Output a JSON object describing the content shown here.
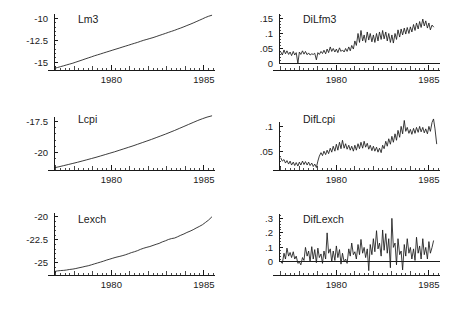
{
  "figure": {
    "width": 450,
    "height": 310,
    "background": "#ffffff",
    "line_color": "#1a1a1a",
    "layout": "2 columns x 3 rows of time-series panels"
  },
  "chart_data": [
    {
      "id": "lm3",
      "type": "line",
      "title": "Lm3",
      "xlabel": "",
      "ylabel": "",
      "grid": false,
      "legend": "none",
      "xlim": [
        1976.9,
        1985.6
      ],
      "ylim": [
        -15.9,
        -9.5
      ],
      "xticks": [
        1980,
        1985
      ],
      "xticklabels": [
        "1980",
        "1985"
      ],
      "yticks": [
        -10,
        -12.5,
        -15
      ],
      "yticklabels": [
        "-10",
        "-12.5",
        "-15"
      ],
      "x": [
        1976.92,
        1977.08,
        1977.25,
        1977.42,
        1977.58,
        1977.75,
        1977.92,
        1978.08,
        1978.25,
        1978.42,
        1978.58,
        1978.75,
        1978.92,
        1979.08,
        1979.25,
        1979.42,
        1979.58,
        1979.75,
        1979.92,
        1980.08,
        1980.25,
        1980.42,
        1980.58,
        1980.75,
        1980.92,
        1981.08,
        1981.25,
        1981.42,
        1981.58,
        1981.75,
        1981.92,
        1982.08,
        1982.25,
        1982.42,
        1982.58,
        1982.75,
        1982.92,
        1983.08,
        1983.25,
        1983.42,
        1983.58,
        1983.75,
        1983.92,
        1984.08,
        1984.25,
        1984.42,
        1984.58,
        1984.75,
        1984.92,
        1985.08,
        1985.25,
        1985.42
      ],
      "values": [
        -15.72,
        -15.62,
        -15.52,
        -15.42,
        -15.32,
        -15.22,
        -15.12,
        -15.0,
        -14.88,
        -14.76,
        -14.64,
        -14.52,
        -14.4,
        -14.28,
        -14.17,
        -14.06,
        -13.95,
        -13.84,
        -13.73,
        -13.62,
        -13.51,
        -13.4,
        -13.29,
        -13.18,
        -13.07,
        -12.96,
        -12.85,
        -12.74,
        -12.62,
        -12.5,
        -12.4,
        -12.3,
        -12.2,
        -12.08,
        -11.96,
        -11.84,
        -11.72,
        -11.6,
        -11.48,
        -11.36,
        -11.23,
        -11.1,
        -10.96,
        -10.82,
        -10.68,
        -10.53,
        -10.38,
        -10.22,
        -10.06,
        -9.9,
        -9.76,
        -9.65
      ]
    },
    {
      "id": "dilfm3",
      "type": "line",
      "title": "DiLfm3",
      "xlabel": "",
      "ylabel": "",
      "grid": false,
      "legend": "none",
      "xlim": [
        1976.9,
        1985.6
      ],
      "ylim": [
        -0.022,
        0.165
      ],
      "xticks": [
        1980,
        1985
      ],
      "xticklabels": [
        "1980",
        "1985"
      ],
      "yticks": [
        0.15,
        0.1,
        0.05,
        0
      ],
      "yticklabels": [
        ".15",
        ".1",
        ".05",
        "0"
      ],
      "zero_line": 0,
      "x": [
        1977.0,
        1977.08,
        1977.17,
        1977.25,
        1977.33,
        1977.42,
        1977.5,
        1977.58,
        1977.67,
        1977.75,
        1977.83,
        1977.92,
        1978.0,
        1978.08,
        1978.17,
        1978.25,
        1978.33,
        1978.42,
        1978.5,
        1978.58,
        1978.67,
        1978.75,
        1978.83,
        1978.92,
        1979.0,
        1979.08,
        1979.17,
        1979.25,
        1979.33,
        1979.42,
        1979.5,
        1979.58,
        1979.67,
        1979.75,
        1979.83,
        1979.92,
        1980.0,
        1980.08,
        1980.17,
        1980.25,
        1980.33,
        1980.42,
        1980.5,
        1980.58,
        1980.67,
        1980.75,
        1980.83,
        1980.92,
        1981.0,
        1981.08,
        1981.17,
        1981.25,
        1981.33,
        1981.42,
        1981.5,
        1981.58,
        1981.67,
        1981.75,
        1981.83,
        1981.92,
        1982.0,
        1982.08,
        1982.17,
        1982.25,
        1982.33,
        1982.42,
        1982.5,
        1982.58,
        1982.67,
        1982.75,
        1982.83,
        1982.92,
        1983.0,
        1983.08,
        1983.17,
        1983.25,
        1983.33,
        1983.42,
        1983.5,
        1983.58,
        1983.67,
        1983.75,
        1983.83,
        1983.92,
        1984.0,
        1984.08,
        1984.17,
        1984.25,
        1984.33,
        1984.42,
        1984.5,
        1984.58,
        1984.67,
        1984.75,
        1984.83,
        1984.92,
        1985.0,
        1985.08,
        1985.17,
        1985.25,
        1985.33,
        1985.42
      ],
      "values": [
        0.038,
        0.028,
        0.045,
        0.032,
        0.042,
        0.03,
        0.038,
        0.026,
        0.04,
        0.028,
        0.036,
        0.0,
        0.038,
        0.03,
        0.042,
        0.031,
        0.04,
        0.029,
        0.035,
        0.028,
        0.032,
        0.03,
        0.034,
        0.012,
        0.036,
        0.03,
        0.04,
        0.033,
        0.044,
        0.032,
        0.048,
        0.036,
        0.055,
        0.04,
        0.05,
        0.038,
        0.048,
        0.036,
        0.052,
        0.04,
        0.045,
        0.038,
        0.05,
        0.04,
        0.055,
        0.042,
        0.06,
        0.048,
        0.075,
        0.06,
        0.1,
        0.07,
        0.11,
        0.075,
        0.095,
        0.07,
        0.105,
        0.078,
        0.1,
        0.072,
        0.095,
        0.07,
        0.1,
        0.075,
        0.105,
        0.08,
        0.11,
        0.082,
        0.105,
        0.075,
        0.1,
        0.07,
        0.095,
        0.068,
        0.1,
        0.08,
        0.112,
        0.088,
        0.115,
        0.095,
        0.118,
        0.098,
        0.12,
        0.1,
        0.122,
        0.105,
        0.13,
        0.11,
        0.135,
        0.115,
        0.14,
        0.12,
        0.148,
        0.125,
        0.142,
        0.118,
        0.135,
        0.112,
        0.128,
        0.122
      ]
    },
    {
      "id": "lcpi",
      "type": "line",
      "title": "Lcpi",
      "xlabel": "",
      "ylabel": "",
      "grid": false,
      "legend": "none",
      "xlim": [
        1976.9,
        1985.6
      ],
      "ylim": [
        -21.4,
        -16.9
      ],
      "xticks": [
        1980,
        1985
      ],
      "xticklabels": [
        "1980",
        "1985"
      ],
      "yticks": [
        -17.5,
        -20
      ],
      "yticklabels": [
        "-17.5",
        "-20"
      ],
      "x": [
        1976.92,
        1977.17,
        1977.42,
        1977.67,
        1977.92,
        1978.17,
        1978.42,
        1978.67,
        1978.92,
        1979.17,
        1979.42,
        1979.67,
        1979.92,
        1980.17,
        1980.42,
        1980.67,
        1980.92,
        1981.17,
        1981.42,
        1981.67,
        1981.92,
        1982.17,
        1982.42,
        1982.67,
        1982.92,
        1983.17,
        1983.42,
        1983.67,
        1983.92,
        1984.17,
        1984.42,
        1984.67,
        1984.92,
        1985.17,
        1985.42
      ],
      "values": [
        -21.22,
        -21.14,
        -21.05,
        -20.96,
        -20.87,
        -20.78,
        -20.68,
        -20.58,
        -20.48,
        -20.38,
        -20.27,
        -20.16,
        -20.05,
        -19.94,
        -19.82,
        -19.7,
        -19.58,
        -19.46,
        -19.33,
        -19.2,
        -19.07,
        -18.94,
        -18.8,
        -18.66,
        -18.52,
        -18.37,
        -18.22,
        -18.06,
        -17.9,
        -17.74,
        -17.58,
        -17.42,
        -17.28,
        -17.15,
        -17.05
      ]
    },
    {
      "id": "diflcpi",
      "type": "line",
      "title": "DifLcpi",
      "xlabel": "",
      "ylabel": "",
      "grid": false,
      "legend": "none",
      "xlim": [
        1976.9,
        1985.6
      ],
      "ylim": [
        0.012,
        0.125
      ],
      "xticks": [
        1980,
        1985
      ],
      "xticklabels": [
        "1980",
        "1985"
      ],
      "yticks": [
        0.1,
        0.05
      ],
      "yticklabels": [
        ".1",
        ".05"
      ],
      "x": [
        1977.0,
        1977.08,
        1977.17,
        1977.25,
        1977.33,
        1977.42,
        1977.5,
        1977.58,
        1977.67,
        1977.75,
        1977.83,
        1977.92,
        1978.0,
        1978.08,
        1978.17,
        1978.25,
        1978.33,
        1978.42,
        1978.5,
        1978.58,
        1978.67,
        1978.75,
        1978.83,
        1978.92,
        1979.0,
        1979.08,
        1979.17,
        1979.25,
        1979.33,
        1979.42,
        1979.5,
        1979.58,
        1979.67,
        1979.75,
        1979.83,
        1979.92,
        1980.0,
        1980.08,
        1980.17,
        1980.25,
        1980.33,
        1980.42,
        1980.5,
        1980.58,
        1980.67,
        1980.75,
        1980.83,
        1980.92,
        1981.0,
        1981.08,
        1981.17,
        1981.25,
        1981.33,
        1981.42,
        1981.5,
        1981.58,
        1981.67,
        1981.75,
        1981.83,
        1981.92,
        1982.0,
        1982.08,
        1982.17,
        1982.25,
        1982.33,
        1982.42,
        1982.5,
        1982.58,
        1982.67,
        1982.75,
        1982.83,
        1982.92,
        1983.0,
        1983.08,
        1983.17,
        1983.25,
        1983.33,
        1983.42,
        1983.5,
        1983.58,
        1983.67,
        1983.75,
        1983.83,
        1983.92,
        1984.0,
        1984.08,
        1984.17,
        1984.25,
        1984.33,
        1984.42,
        1984.5,
        1984.58,
        1984.67,
        1984.75,
        1984.83,
        1984.92,
        1985.0,
        1985.08,
        1985.17,
        1985.25,
        1985.33,
        1985.42
      ],
      "values": [
        0.036,
        0.03,
        0.033,
        0.026,
        0.031,
        0.024,
        0.03,
        0.022,
        0.028,
        0.021,
        0.027,
        0.02,
        0.028,
        0.022,
        0.03,
        0.023,
        0.029,
        0.022,
        0.028,
        0.021,
        0.026,
        0.019,
        0.024,
        0.017,
        0.03,
        0.04,
        0.047,
        0.041,
        0.05,
        0.043,
        0.052,
        0.045,
        0.056,
        0.048,
        0.06,
        0.05,
        0.064,
        0.052,
        0.068,
        0.055,
        0.072,
        0.056,
        0.065,
        0.054,
        0.062,
        0.052,
        0.06,
        0.05,
        0.062,
        0.052,
        0.065,
        0.055,
        0.068,
        0.056,
        0.07,
        0.058,
        0.066,
        0.054,
        0.062,
        0.051,
        0.06,
        0.05,
        0.058,
        0.048,
        0.056,
        0.047,
        0.062,
        0.055,
        0.07,
        0.06,
        0.075,
        0.064,
        0.08,
        0.068,
        0.085,
        0.072,
        0.092,
        0.078,
        0.1,
        0.085,
        0.112,
        0.09,
        0.098,
        0.086,
        0.094,
        0.084,
        0.096,
        0.086,
        0.098,
        0.088,
        0.1,
        0.089,
        0.098,
        0.087,
        0.095,
        0.085,
        0.1,
        0.09,
        0.108,
        0.115,
        0.095,
        0.065
      ]
    },
    {
      "id": "lexch",
      "type": "line",
      "title": "Lexch",
      "xlabel": "",
      "ylabel": "",
      "grid": false,
      "legend": "none",
      "xlim": [
        1976.9,
        1985.6
      ],
      "ylim": [
        -26.3,
        -19.7
      ],
      "xticks": [
        1980,
        1985
      ],
      "xticklabels": [
        "1980",
        "1985"
      ],
      "yticks": [
        -20,
        -22.5,
        -25
      ],
      "yticklabels": [
        "-20",
        "-22.5",
        "-25"
      ],
      "x": [
        1976.92,
        1977.08,
        1977.25,
        1977.42,
        1977.58,
        1977.75,
        1977.92,
        1978.08,
        1978.25,
        1978.42,
        1978.58,
        1978.75,
        1978.92,
        1979.08,
        1979.25,
        1979.42,
        1979.58,
        1979.75,
        1979.92,
        1980.08,
        1980.25,
        1980.42,
        1980.58,
        1980.75,
        1980.92,
        1981.08,
        1981.25,
        1981.42,
        1981.58,
        1981.75,
        1981.92,
        1982.08,
        1982.25,
        1982.42,
        1982.58,
        1982.75,
        1982.92,
        1983.08,
        1983.25,
        1983.42,
        1983.58,
        1983.75,
        1983.92,
        1984.08,
        1984.25,
        1984.42,
        1984.58,
        1984.75,
        1984.92,
        1985.08,
        1985.25,
        1985.42
      ],
      "values": [
        -25.92,
        -25.86,
        -25.82,
        -25.8,
        -25.76,
        -25.7,
        -25.66,
        -25.6,
        -25.52,
        -25.45,
        -25.37,
        -25.3,
        -25.2,
        -25.1,
        -25.0,
        -24.9,
        -24.8,
        -24.68,
        -24.58,
        -24.48,
        -24.38,
        -24.3,
        -24.22,
        -24.12,
        -24.0,
        -23.88,
        -23.78,
        -23.66,
        -23.52,
        -23.4,
        -23.3,
        -23.22,
        -23.1,
        -22.98,
        -22.88,
        -22.72,
        -22.6,
        -22.46,
        -22.36,
        -22.3,
        -22.16,
        -22.0,
        -21.86,
        -21.7,
        -21.56,
        -21.4,
        -21.22,
        -21.05,
        -20.86,
        -20.62,
        -20.36,
        -20.03
      ]
    },
    {
      "id": "diflexch",
      "type": "line",
      "title": "DifLexch",
      "xlabel": "",
      "ylabel": "",
      "grid": false,
      "legend": "none",
      "xlim": [
        1976.9,
        1985.6
      ],
      "ylim": [
        -0.09,
        0.33
      ],
      "xticks": [
        1980,
        1985
      ],
      "xticklabels": [
        "1980",
        "1985"
      ],
      "yticks": [
        0.3,
        0.2,
        0.1,
        0
      ],
      "yticklabels": [
        ".3",
        ".2",
        ".1",
        "0"
      ],
      "zero_line": 0,
      "x": [
        1977.0,
        1977.08,
        1977.17,
        1977.25,
        1977.33,
        1977.42,
        1977.5,
        1977.58,
        1977.67,
        1977.75,
        1977.83,
        1977.92,
        1978.0,
        1978.08,
        1978.17,
        1978.25,
        1978.33,
        1978.42,
        1978.5,
        1978.58,
        1978.67,
        1978.75,
        1978.83,
        1978.92,
        1979.0,
        1979.08,
        1979.17,
        1979.25,
        1979.33,
        1979.42,
        1979.5,
        1979.58,
        1979.67,
        1979.75,
        1979.83,
        1979.92,
        1980.0,
        1980.08,
        1980.17,
        1980.25,
        1980.33,
        1980.42,
        1980.5,
        1980.58,
        1980.67,
        1980.75,
        1980.83,
        1980.92,
        1981.0,
        1981.08,
        1981.17,
        1981.25,
        1981.33,
        1981.42,
        1981.5,
        1981.58,
        1981.67,
        1981.75,
        1981.83,
        1981.92,
        1982.0,
        1982.08,
        1982.17,
        1982.25,
        1982.33,
        1982.42,
        1982.5,
        1982.58,
        1982.67,
        1982.75,
        1982.83,
        1982.92,
        1983.0,
        1983.08,
        1983.17,
        1983.25,
        1983.33,
        1983.42,
        1983.5,
        1983.58,
        1983.67,
        1983.75,
        1983.83,
        1983.92,
        1984.0,
        1984.08,
        1984.17,
        1984.25,
        1984.33,
        1984.42,
        1984.5,
        1984.58,
        1984.67,
        1984.75,
        1984.83,
        1984.92,
        1985.0,
        1985.08,
        1985.17,
        1985.25,
        1985.33,
        1985.42
      ],
      "values": [
        0.0,
        -0.01,
        0.06,
        0.02,
        0.095,
        0.04,
        0.065,
        0.03,
        0.07,
        0.02,
        0.04,
        -0.01,
        0.0,
        -0.02,
        0.03,
        0.01,
        0.1,
        0.04,
        0.075,
        0.0,
        0.105,
        0.02,
        0.085,
        -0.005,
        0.095,
        0.03,
        0.055,
        -0.01,
        0.075,
        0.02,
        0.2,
        0.06,
        0.09,
        0.0,
        0.075,
        0.01,
        0.11,
        0.03,
        0.085,
        -0.015,
        0.06,
        0.0,
        0.02,
        -0.01,
        0.09,
        0.04,
        0.13,
        0.05,
        0.07,
        0.02,
        0.12,
        0.05,
        0.155,
        0.06,
        0.1,
        0.03,
        0.09,
        -0.06,
        0.12,
        0.05,
        0.16,
        0.07,
        0.215,
        0.09,
        0.13,
        0.04,
        0.22,
        0.08,
        0.195,
        0.06,
        0.16,
        -0.04,
        0.3,
        0.1,
        0.13,
        -0.02,
        0.16,
        0.05,
        0.075,
        -0.055,
        0.12,
        0.04,
        0.16,
        0.06,
        0.1,
        0.02,
        0.09,
        0.01,
        0.17,
        0.06,
        0.11,
        0.02,
        0.16,
        0.05,
        0.1,
        0.02,
        0.14,
        0.06,
        0.1,
        0.145
      ]
    }
  ]
}
